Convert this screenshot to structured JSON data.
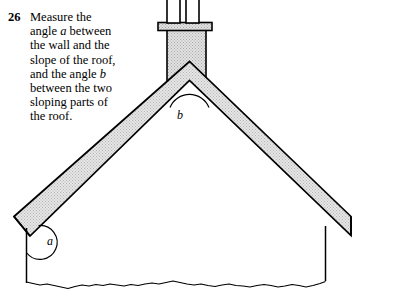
{
  "question": {
    "number": "26",
    "lines": [
      "Measure the",
      "angle a between",
      "the wall and the",
      "slope of the roof,",
      "and the angle b",
      "between the two",
      "sloping parts of",
      "the roof."
    ],
    "text": "Measure the\nangle a between\nthe wall and the\nslope of the roof,\nand the angle b\nbetween the two\nsloping parts of\nthe roof.",
    "italic_variables": [
      "a",
      "b"
    ]
  },
  "figure": {
    "angle_labels": [
      {
        "name": "a",
        "text": "a",
        "x": 47,
        "y": 241,
        "meaning": "angle between wall and slope of roof"
      },
      {
        "name": "b",
        "text": "b",
        "x": 180,
        "y": 114,
        "meaning": "angle between the two sloping parts of the roof"
      }
    ],
    "colors": {
      "outline": "#000000",
      "roof_fill": "#d9d9d9",
      "chimney_fill": "#dcdcdc",
      "chimney_pot_fill": "#ffffff",
      "page_background": "#ffffff"
    },
    "parts": [
      "chimney-pot-left",
      "chimney-pot-right",
      "chimney-cap",
      "chimney-stack",
      "roof-left-slope",
      "roof-right-slope",
      "wall-left",
      "wall-right",
      "ground-line",
      "angle-arc-a",
      "angle-arc-b"
    ]
  }
}
